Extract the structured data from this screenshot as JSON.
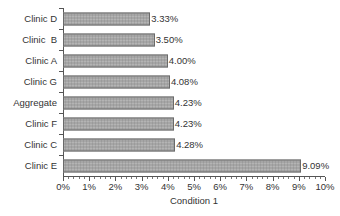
{
  "chart_data": {
    "type": "bar",
    "orientation": "horizontal",
    "title": "",
    "xlabel": "Condition 1",
    "ylabel": "",
    "xlim": [
      0,
      10
    ],
    "grid": false,
    "legend": null,
    "value_suffix": "%",
    "categories": [
      "Clinic D",
      "Clinic  B",
      "Clinic A",
      "Clinic G",
      "Aggregate",
      "Clinic F",
      "Clinic C",
      "Clinic E"
    ],
    "values": [
      3.33,
      3.5,
      4.0,
      4.08,
      4.23,
      4.23,
      4.28,
      9.09
    ],
    "data_labels": [
      "3.33%",
      "3.50%",
      "4.00%",
      "4.08%",
      "4.23%",
      "4.23%",
      "4.28%",
      "9.09%"
    ],
    "xticks": [
      0,
      1,
      2,
      3,
      4,
      5,
      6,
      7,
      8,
      9,
      10
    ],
    "xtick_labels": [
      "0%",
      "1%",
      "2%",
      "3%",
      "4%",
      "5%",
      "6%",
      "7%",
      "8%",
      "9%",
      "10%"
    ],
    "minor_ticks_per_interval": 5,
    "bar_fill_color": "#a6a6a6",
    "bar_border_color": "#6a6a6a",
    "axis_color": "#555555",
    "text_color": "#333333",
    "background_color": "#ffffff"
  }
}
